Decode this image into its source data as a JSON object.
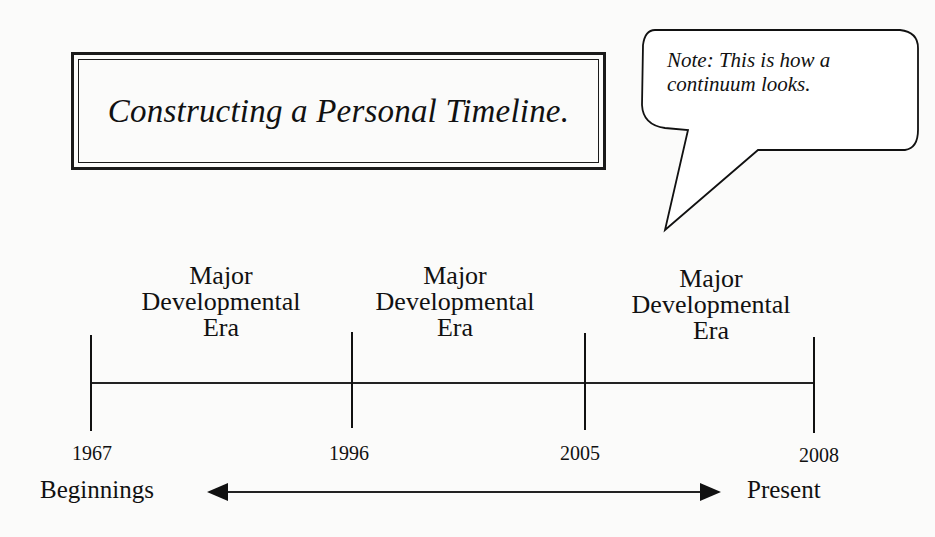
{
  "title": "Constructing a Personal Timeline.",
  "note": {
    "line1": "Note:  This is how a",
    "line2": "continuum looks."
  },
  "eras": [
    {
      "line1": "Major",
      "line2": "Developmental",
      "line3": "Era"
    },
    {
      "line1": "Major",
      "line2": "Developmental",
      "line3": "Era"
    },
    {
      "line1": "Major",
      "line2": "Developmental",
      "line3": "Era"
    }
  ],
  "years": [
    "1967",
    "1996",
    "2005",
    "2008"
  ],
  "continuum": {
    "start_label": "Beginnings",
    "end_label": "Present"
  },
  "colors": {
    "ink": "#111111",
    "background": "#fbfbfa"
  }
}
